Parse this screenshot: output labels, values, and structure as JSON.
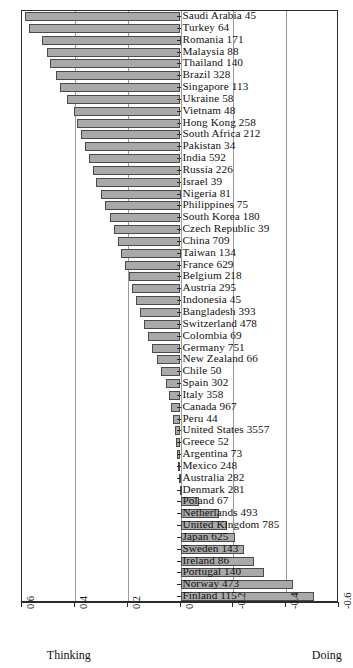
{
  "chart_data": {
    "type": "bar",
    "orientation": "horizontal-diverging",
    "title": "",
    "subtitle": "",
    "xlabel": "",
    "ylabel": "",
    "xlim": [
      0.6,
      -0.6
    ],
    "x_axis_reversed": true,
    "grid": true,
    "gridlines": [
      0.6,
      0.4,
      0.2,
      0.0,
      -0.2,
      -0.4,
      -0.6
    ],
    "xticks": [
      0.6,
      0.4,
      0.2,
      0.0,
      -0.2,
      -0.4,
      -0.6
    ],
    "xticklabels": [
      "0.6",
      "0.4",
      "0.2",
      "0",
      "-0.2",
      "-0.4",
      "-0.6"
    ],
    "axis_end_labels": {
      "left": "Thinking",
      "right": "Doing"
    },
    "legend": null,
    "bar_fill": "#a9a9a9",
    "bar_stroke": "#4a4a4a",
    "categories": [
      "Saudi Arabia",
      "Turkey",
      "Romania",
      "Malaysia",
      "Thailand",
      "Brazil",
      "Singapore",
      "Ukraine",
      "Vietnam",
      "Hong Kong",
      "South Africa",
      "Pakistan",
      "India",
      "Russia",
      "Israel",
      "Nigeria",
      "Philippines",
      "South Korea",
      "Czech Republic",
      "China",
      "Taiwan",
      "France",
      "Belgium",
      "Austria",
      "Indonesia",
      "Bangladesh",
      "Switzerland",
      "Colombia",
      "Germany",
      "New Zealand",
      "Chile",
      "Spain",
      "Italy",
      "Canada",
      "Peru",
      "United States",
      "Greece",
      "Argentina",
      "Mexico",
      "Australia",
      "Denmark",
      "Poland",
      "Netherlands",
      "United Kingdom",
      "Japan",
      "Sweden",
      "Ireland",
      "Portugal",
      "Norway",
      "Finland"
    ],
    "counts": [
      45,
      64,
      171,
      88,
      140,
      328,
      113,
      58,
      48,
      258,
      212,
      34,
      592,
      226,
      39,
      81,
      75,
      180,
      39,
      709,
      134,
      629,
      218,
      295,
      45,
      393,
      478,
      69,
      751,
      66,
      50,
      302,
      358,
      967,
      44,
      3557,
      52,
      73,
      248,
      282,
      281,
      67,
      493,
      785,
      625,
      143,
      86,
      140,
      473,
      115
    ],
    "values": [
      0.589,
      0.575,
      0.525,
      0.505,
      0.493,
      0.47,
      0.455,
      0.43,
      0.405,
      0.393,
      0.378,
      0.36,
      0.345,
      0.33,
      0.318,
      0.3,
      0.285,
      0.268,
      0.252,
      0.238,
      0.225,
      0.21,
      0.196,
      0.183,
      0.17,
      0.155,
      0.14,
      0.123,
      0.108,
      0.09,
      0.072,
      0.056,
      0.045,
      0.036,
      0.028,
      0.022,
      0.017,
      0.013,
      0.01,
      0.006,
      0.002,
      -0.07,
      -0.145,
      -0.175,
      -0.205,
      -0.24,
      -0.28,
      -0.315,
      -0.425,
      -0.505
    ],
    "labels": [
      "Saudi Arabia 45",
      "Turkey 64",
      "Romania 171",
      "Malaysia 88",
      "Thailand 140",
      "Brazil 328",
      "Singapore 113",
      "Ukraine 58",
      "Vietnam 48",
      "Hong Kong 258",
      "South Africa 212",
      "Pakistan 34",
      "India 592",
      "Russia 226",
      "Israel 39",
      "Nigeria 81",
      "Philippines 75",
      "South Korea 180",
      "Czech Republic 39",
      "China 709",
      "Taiwan 134",
      "France 629",
      "Belgium 218",
      "Austria 295",
      "Indonesia 45",
      "Bangladesh 393",
      "Switzerland 478",
      "Colombia 69",
      "Germany 751",
      "New Zealand 66",
      "Chile 50",
      "Spain 302",
      "Italy 358",
      "Canada 967",
      "Peru 44",
      "United States 3557",
      "Greece 52",
      "Argentina 73",
      "Mexico 248",
      "Australia 282",
      "Denmark 281",
      "Poland 67",
      "Netherlands 493",
      "United Kingdom 785",
      "Japan 625",
      "Sweden 143",
      "Ireland 86",
      "Portugal 140",
      "Norway 473",
      "Finland 115"
    ]
  }
}
